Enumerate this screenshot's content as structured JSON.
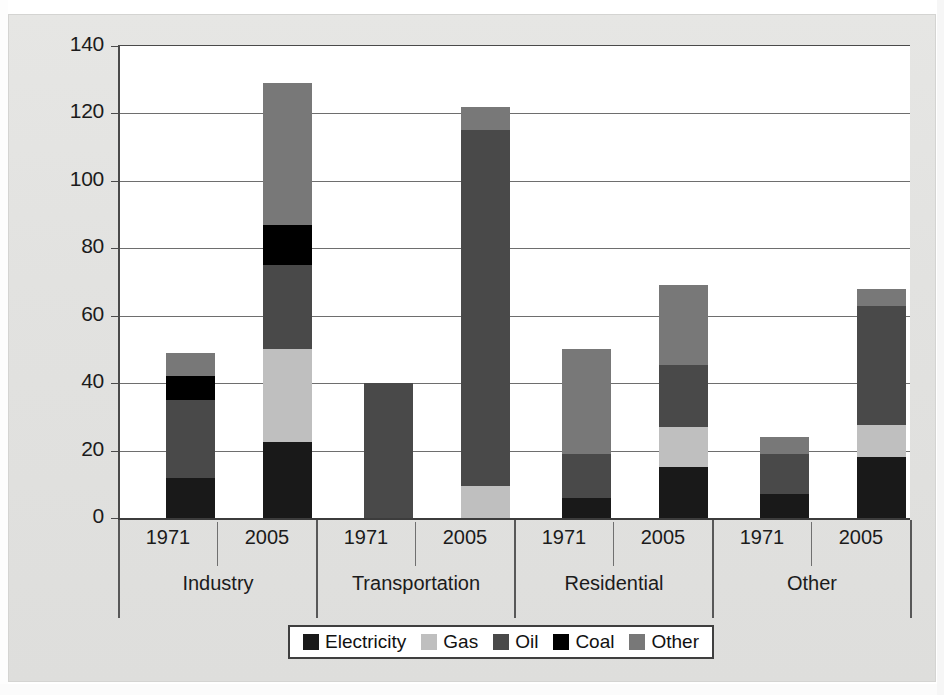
{
  "chart_data": {
    "type": "bar",
    "subtype": "stacked-grouped",
    "title": "",
    "xlabel": "",
    "ylabel": "",
    "ylim": [
      0,
      140
    ],
    "yticks": [
      "0",
      "20",
      "40",
      "60",
      "80",
      "100",
      "120",
      "140"
    ],
    "ytick_values": [
      0,
      20,
      40,
      60,
      80,
      100,
      120,
      140
    ],
    "grid": true,
    "legend_position": "bottom",
    "groups": [
      "Industry",
      "Transportation",
      "Residential",
      "Other"
    ],
    "categories": [
      "1971",
      "2005",
      "1971",
      "2005",
      "1971",
      "2005",
      "1971",
      "2005"
    ],
    "series": [
      {
        "name": "Electricity",
        "color": "#191919",
        "values": [
          12,
          22.5,
          0,
          0,
          6,
          15,
          7,
          18
        ]
      },
      {
        "name": "Gas",
        "color": "#bfbfbf",
        "values": [
          0,
          27.5,
          0,
          9.5,
          0,
          12,
          0,
          9.5
        ]
      },
      {
        "name": "Oil",
        "color": "#494949",
        "values": [
          23,
          25,
          40,
          105.5,
          13,
          18.5,
          12,
          35.5
        ]
      },
      {
        "name": "Coal",
        "color": "#000000",
        "values": [
          7,
          12,
          0,
          0,
          0,
          0,
          0,
          0
        ]
      },
      {
        "name": "Other",
        "color": "#787878",
        "values": [
          7,
          42,
          0,
          7,
          31,
          23.5,
          5,
          5
        ]
      }
    ],
    "totals": [
      49,
      129,
      40,
      122,
      50,
      69,
      24,
      68
    ],
    "bars": [
      {
        "group": "Industry",
        "year": "1971",
        "total": 49,
        "stack": [
          {
            "name": "Electricity",
            "value": 12,
            "from": 0,
            "to": 12
          },
          {
            "name": "Oil",
            "value": 23,
            "from": 12,
            "to": 35
          },
          {
            "name": "Coal",
            "value": 7,
            "from": 35,
            "to": 42
          },
          {
            "name": "Other",
            "value": 7,
            "from": 42,
            "to": 49
          }
        ]
      },
      {
        "group": "Industry",
        "year": "2005",
        "total": 129,
        "stack": [
          {
            "name": "Electricity",
            "value": 22.5,
            "from": 0,
            "to": 22.5
          },
          {
            "name": "Gas",
            "value": 27.5,
            "from": 22.5,
            "to": 50
          },
          {
            "name": "Oil",
            "value": 25,
            "from": 50,
            "to": 75
          },
          {
            "name": "Coal",
            "value": 12,
            "from": 75,
            "to": 87
          },
          {
            "name": "Other",
            "value": 42,
            "from": 87,
            "to": 129
          }
        ]
      },
      {
        "group": "Transportation",
        "year": "1971",
        "total": 40,
        "stack": [
          {
            "name": "Oil",
            "value": 40,
            "from": 0,
            "to": 40
          }
        ]
      },
      {
        "group": "Transportation",
        "year": "2005",
        "total": 122,
        "stack": [
          {
            "name": "Gas",
            "value": 9.5,
            "from": 0,
            "to": 9.5
          },
          {
            "name": "Oil",
            "value": 105.5,
            "from": 9.5,
            "to": 115
          },
          {
            "name": "Other",
            "value": 7,
            "from": 115,
            "to": 122
          }
        ]
      },
      {
        "group": "Residential",
        "year": "1971",
        "total": 50,
        "stack": [
          {
            "name": "Electricity",
            "value": 6,
            "from": 0,
            "to": 6
          },
          {
            "name": "Oil",
            "value": 13,
            "from": 6,
            "to": 19
          },
          {
            "name": "Other",
            "value": 31,
            "from": 19,
            "to": 50
          }
        ]
      },
      {
        "group": "Residential",
        "year": "2005",
        "total": 69,
        "stack": [
          {
            "name": "Electricity",
            "value": 15,
            "from": 0,
            "to": 15
          },
          {
            "name": "Gas",
            "value": 12,
            "from": 15,
            "to": 27
          },
          {
            "name": "Oil",
            "value": 18.5,
            "from": 27,
            "to": 45.5
          },
          {
            "name": "Other",
            "value": 23.5,
            "from": 45.5,
            "to": 69
          }
        ]
      },
      {
        "group": "Other",
        "year": "1971",
        "total": 24,
        "stack": [
          {
            "name": "Electricity",
            "value": 7,
            "from": 0,
            "to": 7
          },
          {
            "name": "Oil",
            "value": 12,
            "from": 7,
            "to": 19
          },
          {
            "name": "Other",
            "value": 5,
            "from": 19,
            "to": 24
          }
        ]
      },
      {
        "group": "Other",
        "year": "2005",
        "total": 68,
        "stack": [
          {
            "name": "Electricity",
            "value": 18,
            "from": 0,
            "to": 18
          },
          {
            "name": "Gas",
            "value": 9.5,
            "from": 18,
            "to": 27.5
          },
          {
            "name": "Oil",
            "value": 35.5,
            "from": 27.5,
            "to": 63
          },
          {
            "name": "Other",
            "value": 5,
            "from": 63,
            "to": 68
          }
        ]
      }
    ],
    "legend": [
      {
        "label": "Electricity",
        "color": "#191919"
      },
      {
        "label": "Gas",
        "color": "#bfbfbf"
      },
      {
        "label": "Oil",
        "color": "#494949"
      },
      {
        "label": "Coal",
        "color": "#000000"
      },
      {
        "label": "Other",
        "color": "#787878"
      }
    ]
  },
  "colors": {
    "paper": "#e3e3e1",
    "plot_background": "#ffffff",
    "gridline": "#6e6e6e",
    "axis": "#3c3c3c",
    "text": "#1b1b1b"
  }
}
